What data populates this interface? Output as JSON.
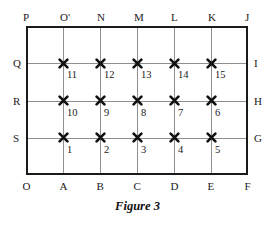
{
  "figure": {
    "caption": "Figure 3",
    "geometry": {
      "rect_left": 26,
      "rect_top": 26,
      "rect_width": 222,
      "rect_height": 149,
      "columns": 6,
      "rows": 4,
      "col_step": 37,
      "row_step": 37.25
    },
    "top_labels": [
      {
        "text": "P",
        "col": 0
      },
      {
        "text": "O'",
        "col": 1
      },
      {
        "text": "N",
        "col": 2
      },
      {
        "text": "M",
        "col": 3
      },
      {
        "text": "L",
        "col": 4
      },
      {
        "text": "K",
        "col": 5
      },
      {
        "text": "J",
        "col": 6
      }
    ],
    "bottom_labels": [
      {
        "text": "O",
        "col": 0
      },
      {
        "text": "A",
        "col": 1
      },
      {
        "text": "B",
        "col": 2
      },
      {
        "text": "C",
        "col": 3
      },
      {
        "text": "D",
        "col": 4
      },
      {
        "text": "E",
        "col": 5
      },
      {
        "text": "F",
        "col": 6
      }
    ],
    "left_labels": [
      {
        "text": "Q",
        "row": 1
      },
      {
        "text": "R",
        "row": 2
      },
      {
        "text": "S",
        "row": 3
      }
    ],
    "right_labels": [
      {
        "text": "I",
        "row": 1
      },
      {
        "text": "H",
        "row": 2
      },
      {
        "text": "G",
        "row": 3
      }
    ],
    "points": [
      {
        "label": "11",
        "col": 1,
        "row": 1
      },
      {
        "label": "12",
        "col": 2,
        "row": 1
      },
      {
        "label": "13",
        "col": 3,
        "row": 1
      },
      {
        "label": "14",
        "col": 4,
        "row": 1
      },
      {
        "label": "15",
        "col": 5,
        "row": 1
      },
      {
        "label": "10",
        "col": 1,
        "row": 2
      },
      {
        "label": "9",
        "col": 2,
        "row": 2
      },
      {
        "label": "8",
        "col": 3,
        "row": 2
      },
      {
        "label": "7",
        "col": 4,
        "row": 2
      },
      {
        "label": "6",
        "col": 5,
        "row": 2
      },
      {
        "label": "1",
        "col": 1,
        "row": 3
      },
      {
        "label": "2",
        "col": 2,
        "row": 3
      },
      {
        "label": "3",
        "col": 3,
        "row": 3
      },
      {
        "label": "4",
        "col": 4,
        "row": 3
      },
      {
        "label": "5",
        "col": 5,
        "row": 3
      }
    ],
    "colors": {
      "border": "#1a1a1a",
      "gridline": "#8f8f8f",
      "marker": "#111111",
      "text": "#1a1a1a",
      "background": "#ffffff"
    }
  }
}
